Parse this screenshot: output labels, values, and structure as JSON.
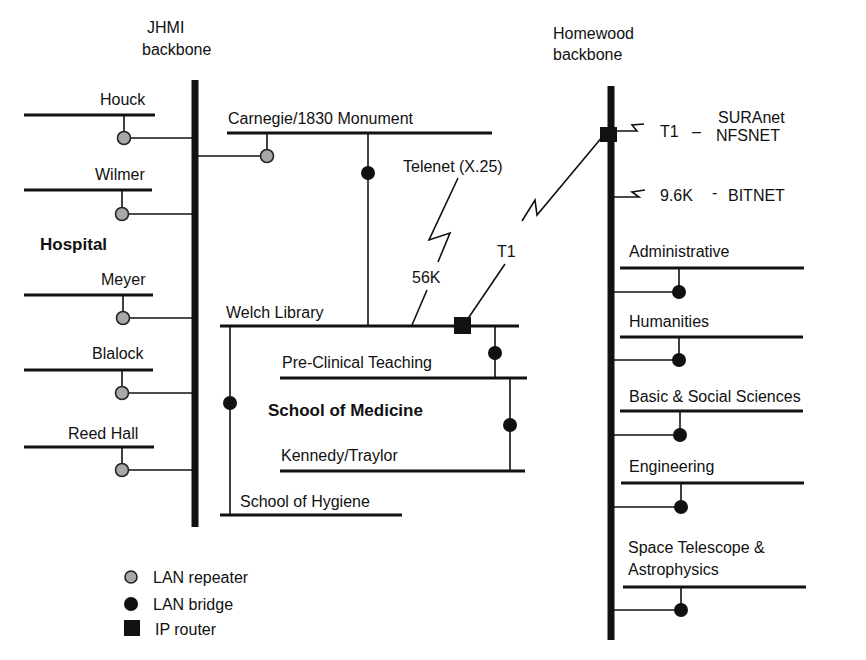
{
  "diagram": {
    "backbones": {
      "jhmi": {
        "line1": "JHMI",
        "line2": "backbone"
      },
      "homewood": {
        "line1": "Homewood",
        "line2": "backbone"
      }
    },
    "groups": {
      "hospital": "Hospital",
      "school_of_medicine": "School of Medicine"
    },
    "hospital_segments": [
      "Houck",
      "Wilmer",
      "Meyer",
      "Blalock",
      "Reed Hall"
    ],
    "jhmi_segments": {
      "carnegie": "Carnegie/1830 Monument",
      "welch": "Welch Library",
      "preclinical": "Pre-Clinical Teaching",
      "kennedy": "Kennedy/Traylor",
      "hygiene": "School of Hygiene"
    },
    "links": {
      "telenet": "Telenet (X.25)",
      "telenet_speed": "56K",
      "t1_link": "T1",
      "ext_t1": "T1",
      "ext_t1_dash": "–",
      "suranet": "SURAnet",
      "nfsnet": "NFSNET",
      "ext_96": "9.6K",
      "ext_96_dash": "-",
      "bitnet": "BITNET"
    },
    "homewood_segments": {
      "administrative": "Administrative",
      "humanities": "Humanities",
      "basic": "Basic & Social Sciences",
      "engineering": "Engineering",
      "space1": "Space Telescope &",
      "space2": "Astrophysics"
    },
    "legend": {
      "repeater": "LAN repeater",
      "bridge": "LAN bridge",
      "router": "IP router"
    },
    "colors": {
      "line": "#111111",
      "repeater_fill": "#a8a8a8",
      "background": "#ffffff"
    }
  }
}
